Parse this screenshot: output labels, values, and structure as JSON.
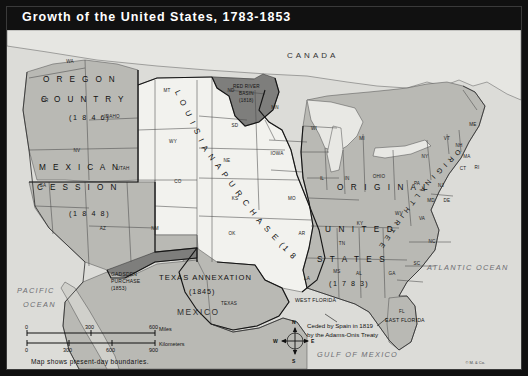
{
  "title": "Growth of the United States, 1783-1853",
  "footer_note": "Map shows present-day boundaries.",
  "copyright": "© M. & Co.",
  "countries": [
    {
      "name": "CANADA"
    },
    {
      "name": "MEXICO"
    }
  ],
  "oceans": [
    {
      "name_line1": "PACIFIC",
      "name_line2": "OCEAN"
    },
    {
      "name": "ATLANTIC OCEAN"
    },
    {
      "name": "GULF OF MEXICO"
    }
  ],
  "territories": [
    {
      "name": "OREGON COUNTRY",
      "line1": "O R E G O N",
      "line2": "C O U N T R Y",
      "year": "(1 8 4 6)"
    },
    {
      "name": "MEXICAN CESSION",
      "line1": "M E X I C A N",
      "line2": "C E S S I O N",
      "year": "(1 8 4 8)"
    },
    {
      "name": "LOUISIANA PURCHASE",
      "curve_text": "L O U I S I A N A   P U R C H A S E   (1 8 0 3)"
    },
    {
      "name": "RED RIVER BASIN",
      "line1": "RED RIVER",
      "line2": "BASIN",
      "year": "(1818)"
    },
    {
      "name": "TEXAS ANNEXATION",
      "line1": "TEXAS ANNEXATION",
      "year": "(1845)"
    },
    {
      "name": "GADSDEN PURCHASE",
      "line1": "GADSDEN",
      "line2": "PURCHASE",
      "year": "(1853)"
    },
    {
      "name": "ORIGINAL UNITED STATES",
      "line1": "O R I G I N A L",
      "line2": "U N I T E D",
      "line3": "S T A T E S",
      "year": "(1 7 8 3)"
    },
    {
      "name": "ORIGINAL THIRTEEN STATES",
      "curve_text": "O R I G I N A L   T H I R T E E N   S T A T E S"
    },
    {
      "name": "WEST FLORIDA",
      "label": "WEST FLORIDA"
    },
    {
      "name": "EAST FLORIDA",
      "label": "EAST FLORIDA"
    }
  ],
  "annotation": {
    "line1": "Ceded by Spain in 1819",
    "line2": "by the Adams-Onis Treaty"
  },
  "state_labels": [
    {
      "abbr": "WA",
      "x": 63,
      "y": 33
    },
    {
      "abbr": "OR",
      "x": 38,
      "y": 72
    },
    {
      "abbr": "IDAHO",
      "x": 105,
      "y": 88
    },
    {
      "abbr": "MT",
      "x": 160,
      "y": 62
    },
    {
      "abbr": "WY",
      "x": 166,
      "y": 113
    },
    {
      "abbr": "ND",
      "x": 224,
      "y": 62
    },
    {
      "abbr": "SD",
      "x": 228,
      "y": 97
    },
    {
      "abbr": "NE",
      "x": 220,
      "y": 132
    },
    {
      "abbr": "MN",
      "x": 268,
      "y": 79
    },
    {
      "abbr": "IOWA",
      "x": 270,
      "y": 125
    },
    {
      "abbr": "WI",
      "x": 307,
      "y": 100
    },
    {
      "abbr": "MI",
      "x": 355,
      "y": 110
    },
    {
      "abbr": "NV",
      "x": 70,
      "y": 122
    },
    {
      "abbr": "CA",
      "x": 36,
      "y": 157
    },
    {
      "abbr": "UTAH",
      "x": 116,
      "y": 140
    },
    {
      "abbr": "CO",
      "x": 171,
      "y": 153
    },
    {
      "abbr": "AZ",
      "x": 96,
      "y": 200
    },
    {
      "abbr": "NM",
      "x": 148,
      "y": 200
    },
    {
      "abbr": "KS",
      "x": 228,
      "y": 170
    },
    {
      "abbr": "OK",
      "x": 225,
      "y": 205
    },
    {
      "abbr": "MO",
      "x": 285,
      "y": 170
    },
    {
      "abbr": "AR",
      "x": 295,
      "y": 205
    },
    {
      "abbr": "LA",
      "x": 300,
      "y": 250
    },
    {
      "abbr": "MS",
      "x": 330,
      "y": 243
    },
    {
      "abbr": "AL",
      "x": 352,
      "y": 245
    },
    {
      "abbr": "TN",
      "x": 335,
      "y": 215
    },
    {
      "abbr": "KY",
      "x": 353,
      "y": 195
    },
    {
      "abbr": "IL",
      "x": 315,
      "y": 150
    },
    {
      "abbr": "IN",
      "x": 340,
      "y": 150
    },
    {
      "abbr": "OHIO",
      "x": 372,
      "y": 148
    },
    {
      "abbr": "WV",
      "x": 392,
      "y": 185
    },
    {
      "abbr": "VA",
      "x": 415,
      "y": 190
    },
    {
      "abbr": "NC",
      "x": 425,
      "y": 213
    },
    {
      "abbr": "SC",
      "x": 410,
      "y": 235
    },
    {
      "abbr": "GA",
      "x": 385,
      "y": 245
    },
    {
      "abbr": "FL",
      "x": 395,
      "y": 283
    },
    {
      "abbr": "PA",
      "x": 410,
      "y": 155
    },
    {
      "abbr": "NY",
      "x": 418,
      "y": 128
    },
    {
      "abbr": "VT",
      "x": 440,
      "y": 110
    },
    {
      "abbr": "NH",
      "x": 452,
      "y": 117
    },
    {
      "abbr": "MA",
      "x": 460,
      "y": 128
    },
    {
      "abbr": "CT",
      "x": 456,
      "y": 140
    },
    {
      "abbr": "RI",
      "x": 470,
      "y": 139
    },
    {
      "abbr": "NJ",
      "x": 434,
      "y": 157
    },
    {
      "abbr": "MD",
      "x": 424,
      "y": 172
    },
    {
      "abbr": "DE",
      "x": 440,
      "y": 172
    },
    {
      "abbr": "ME",
      "x": 466,
      "y": 96
    },
    {
      "abbr": "TEXAS",
      "x": 222,
      "y": 275
    }
  ],
  "scale": {
    "miles_ticks": [
      "0",
      "300",
      "600"
    ],
    "miles_unit": "Miles",
    "km_ticks": [
      "0",
      "300",
      "600",
      "900"
    ],
    "km_unit": "Kilometers"
  },
  "compass": {
    "n": "N",
    "e": "E",
    "s": "S",
    "w": "W"
  },
  "colors": {
    "frame": "#101010",
    "title_bg": "#111111",
    "title_text": "#ffffff",
    "ocean": "#dcdcd8",
    "light_region": "#f2f2ee",
    "mid_region": "#b9b9b4",
    "dark_region": "#7e7e7c"
  }
}
